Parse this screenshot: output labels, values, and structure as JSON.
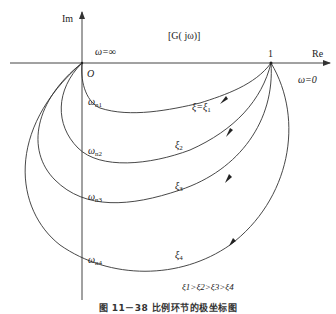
{
  "diagram": {
    "type": "nyquist-plot",
    "axes": {
      "x_label": "Re",
      "y_label": "Im",
      "origin_label": "O",
      "unit_point_label": "1"
    },
    "annotations": {
      "omega_infinity": "ω=∞",
      "omega_zero": "ω=0",
      "damping_order": "ξ1>ξ2>ξ3>ξ4"
    },
    "curves": [
      {
        "id": "xi1",
        "label": "ξ=ξ1",
        "omega_label": "ωn1",
        "color": "#333333"
      },
      {
        "id": "xi2",
        "label": "ξ2",
        "omega_label": "ωn2",
        "color": "#333333"
      },
      {
        "id": "xi3",
        "label": "ξ3",
        "omega_label": "ωn3",
        "color": "#333333"
      },
      {
        "id": "xi4",
        "label": "ξ4",
        "omega_label": "ωn4",
        "color": "#333333"
      }
    ],
    "caption": "图 11－38  比例环节的极坐标图"
  },
  "labels": {
    "im": "Im",
    "re": "Re",
    "origin": "O",
    "one": "1",
    "title": "[G( jω)]",
    "omega_inf": "ω=∞",
    "omega_zero": "ω=0",
    "xi1": "ξ=ξ",
    "xi1_sub": "1",
    "xi2": "ξ",
    "xi2_sub": "2",
    "xi3": "ξ",
    "xi3_sub": "3",
    "xi4": "ξ",
    "xi4_sub": "4",
    "wn": "ω",
    "wn1_sub": "n1",
    "wn2_sub": "n2",
    "wn3_sub": "n3",
    "wn4_sub": "n4",
    "order": "ξ1>ξ2>ξ3>ξ4"
  }
}
